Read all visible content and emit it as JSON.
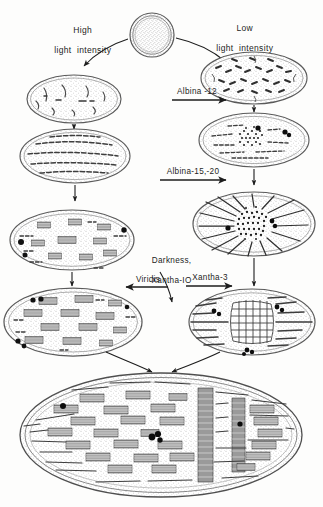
{
  "figure": {
    "domain_note": "plastid-development-pathway",
    "background_color": "#fdfdfc",
    "ink_color": "#1d1d1d",
    "stipple_color": "#8d8d8d",
    "membrane_color": "#5a5a5a",
    "granum_fill": "#9a9a9a",
    "globule_color": "#111111"
  },
  "labels": {
    "high_light": "High\nlight  intensity",
    "low_light": "Low\nlight  intensity",
    "albina_12": "Albina -12",
    "albina_15_20": "Albina-15,-20",
    "darkness_xantha_10": "Darkness,\nXantha-IO",
    "xantha_3": "Xantha-3",
    "viridis": "Viridis"
  },
  "label_lines": {
    "high_light_1": "High",
    "high_light_2": "light  intensity",
    "low_light_1": "Low",
    "low_light_2": "light  intensity",
    "darkness_1": "Darkness,",
    "darkness_2": "Xantha-IO"
  },
  "plastids": [
    {
      "id": "proplastid",
      "name": "proplastid",
      "shape": "circle",
      "cx": 152,
      "cy": 35,
      "r": 22,
      "description": "small round proplastid with dense stipple and double envelope"
    },
    {
      "id": "high-light-young",
      "name": "young-plastid-high-light",
      "shape": "ellipse",
      "cx": 74,
      "cy": 99,
      "rx": 47,
      "ry": 24,
      "description": "flattened plastid with short scattered vesicular lamellae"
    },
    {
      "id": "high-light-lamellar",
      "name": "plastid-with-lamellae",
      "shape": "ellipse",
      "cx": 75,
      "cy": 156,
      "rx": 55,
      "ry": 27,
      "description": "plastid with long parallel dashed primary lamellae"
    },
    {
      "id": "high-light-grana",
      "name": "plastid-with-early-grana",
      "shape": "ellipse",
      "cx": 72,
      "cy": 240,
      "rx": 62,
      "ry": 30,
      "description": "plastid with small grana stacks and dark plastoglobuli"
    },
    {
      "id": "viridis-plastid",
      "name": "viridis-mutant-plastid",
      "shape": "ellipse",
      "cx": 73,
      "cy": 322,
      "rx": 69,
      "ry": 34,
      "description": "plastid with numerous well-formed grana stacks and globuli"
    },
    {
      "id": "low-light-young",
      "name": "young-plastid-low-light",
      "shape": "ellipse",
      "cx": 254,
      "cy": 78,
      "rx": 53,
      "ry": 26,
      "description": "plastid filled with many short scattered tubular profiles"
    },
    {
      "id": "albina12-block",
      "name": "plastid-prolamellar-body-early",
      "shape": "ellipse",
      "cx": 254,
      "cy": 140,
      "rx": 55,
      "ry": 27,
      "description": "plastid with condensing central prolamellar body and dark globuli"
    },
    {
      "id": "etioplast",
      "name": "etioplast-radiating",
      "shape": "ellipse",
      "cx": 254,
      "cy": 224,
      "rx": 61,
      "ry": 32,
      "description": "etioplast with central prolamellar body and radiating prothylakoids"
    },
    {
      "id": "xantha3-plastid",
      "name": "xantha-3-mutant-plastid",
      "shape": "ellipse",
      "cx": 252,
      "cy": 322,
      "rx": 63,
      "ry": 33,
      "description": "plastid with crystalline lattice prolamellar body and lamellae"
    },
    {
      "id": "mature-chloroplast",
      "name": "mature-chloroplast",
      "shape": "ellipse",
      "cx": 161,
      "cy": 435,
      "rx": 141,
      "ry": 62,
      "description": "large mature chloroplast with extensive grana and stroma thylakoids"
    }
  ],
  "arrows": [
    {
      "id": "a1",
      "name": "arrow-proplastid-to-high-light",
      "type": "curved",
      "from": "proplastid",
      "to": "high-light-young"
    },
    {
      "id": "a2",
      "name": "arrow-proplastid-to-low-light",
      "type": "curved",
      "from": "proplastid",
      "to": "low-light-young"
    },
    {
      "id": "a3",
      "name": "arrow-high-light-young-to-lamellar",
      "type": "vertical",
      "from": "high-light-young",
      "to": "high-light-lamellar"
    },
    {
      "id": "a4",
      "name": "arrow-lamellar-to-grana",
      "type": "vertical",
      "from": "high-light-lamellar",
      "to": "high-light-grana"
    },
    {
      "id": "a5",
      "name": "arrow-grana-to-viridis",
      "type": "vertical",
      "from": "high-light-grana",
      "to": "viridis-plastid"
    },
    {
      "id": "a6",
      "name": "arrow-low-light-young-to-albina12",
      "type": "vertical",
      "from": "low-light-young",
      "to": "albina12-block"
    },
    {
      "id": "a7",
      "name": "arrow-albina12-to-etioplast",
      "type": "vertical",
      "from": "albina12-block",
      "to": "etioplast"
    },
    {
      "id": "a8",
      "name": "arrow-etioplast-to-xantha3",
      "type": "vertical",
      "from": "etioplast",
      "to": "xantha3-plastid"
    },
    {
      "id": "a9",
      "name": "arrow-albina-12-block",
      "type": "horizontal",
      "label": "Albina -12"
    },
    {
      "id": "a10",
      "name": "arrow-albina-15-20-block",
      "type": "horizontal",
      "label": "Albina-15,-20"
    },
    {
      "id": "a11",
      "name": "arrow-xantha-3-block",
      "type": "horizontal",
      "label": "Xantha-3"
    },
    {
      "id": "a12",
      "name": "arrow-viridis-block",
      "type": "horizontal-left",
      "label": "Viridis"
    },
    {
      "id": "a13",
      "name": "arrow-darkness-xantha10",
      "type": "diagonal",
      "label": "Darkness, Xantha-IO"
    },
    {
      "id": "a14",
      "name": "arrow-viridis-to-chloroplast",
      "type": "diagonal",
      "from": "viridis-plastid",
      "to": "mature-chloroplast"
    },
    {
      "id": "a15",
      "name": "arrow-xantha3-to-chloroplast",
      "type": "diagonal",
      "from": "xantha3-plastid",
      "to": "mature-chloroplast"
    }
  ]
}
